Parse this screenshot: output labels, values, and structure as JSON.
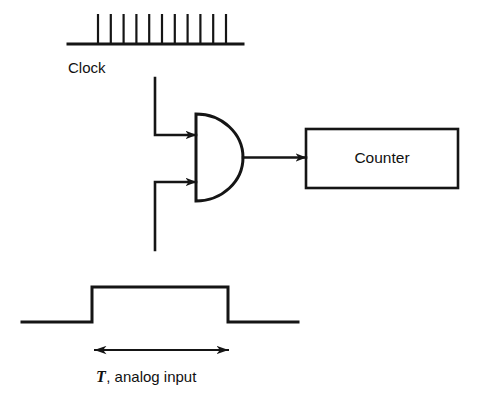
{
  "figure": {
    "background_color": "#ffffff",
    "line_color": "#151515"
  },
  "clock": {
    "label": "Clock",
    "pulse_count": 11,
    "baseline": {
      "x_start": 68,
      "x_end": 243,
      "y": 44
    },
    "pulse": {
      "first_x": 98,
      "spacing": 12.8,
      "top_y": 14,
      "height": 30
    },
    "label_position": {
      "x": 68,
      "y": 73
    }
  },
  "gate": {
    "type": "and-gate",
    "body": {
      "left_x": 196,
      "top_y": 114,
      "bottom_y": 201,
      "tip_x": 243,
      "center_y": 157.5
    },
    "inputs": [
      {
        "name": "clock-input",
        "label": "",
        "arrow_tip_x": 196,
        "y": 135,
        "wire_from_x": 155
      },
      {
        "name": "analog-input",
        "label": "",
        "arrow_tip_x": 196,
        "y": 182,
        "wire_from_x": 155
      }
    ],
    "output": {
      "from_x": 243,
      "to_x": 306,
      "y": 157.5
    },
    "clock_feed_wire": {
      "x": 155,
      "y_top": 78,
      "y_bottom": 135
    },
    "analog_feed_wire": {
      "x": 155,
      "y_top": 182,
      "y_bottom": 250
    }
  },
  "counter": {
    "label": "Counter",
    "box": {
      "x": 306,
      "y": 129,
      "width": 152,
      "height": 59
    },
    "label_position": {
      "x": 382,
      "y": 163
    }
  },
  "analog_waveform": {
    "low_y": 322,
    "high_y": 287,
    "x_start": 22,
    "rise_x": 92,
    "fall_x": 228,
    "x_end": 298
  },
  "duration_marker": {
    "symbol": "T",
    "text": ", analog input",
    "arrow": {
      "x_left": 95,
      "x_right": 228,
      "y": 350
    },
    "label_position": {
      "x": 96,
      "y": 382
    }
  }
}
